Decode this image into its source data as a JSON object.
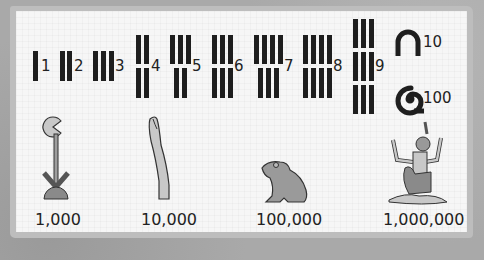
{
  "colors": {
    "stroke": "#1e1e1e",
    "glyph_fill": "#bdbdbd",
    "glyph_dark": "#8a8a8a",
    "paper": "#f6f6f6",
    "border": "#bdbdbd"
  },
  "numerals": [
    {
      "value_label": "1",
      "glyph": "single-stroke-icon"
    },
    {
      "value_label": "2",
      "glyph": "two-strokes-icon"
    },
    {
      "value_label": "3",
      "glyph": "three-strokes-icon"
    },
    {
      "value_label": "4",
      "glyph": "four-strokes-icon"
    },
    {
      "value_label": "5",
      "glyph": "five-strokes-icon"
    },
    {
      "value_label": "6",
      "glyph": "six-strokes-icon"
    },
    {
      "value_label": "7",
      "glyph": "seven-strokes-icon"
    },
    {
      "value_label": "8",
      "glyph": "eight-strokes-icon"
    },
    {
      "value_label": "9",
      "glyph": "nine-strokes-icon"
    },
    {
      "value_label": "10",
      "glyph": "heel-bone-icon"
    },
    {
      "value_label": "100",
      "glyph": "coil-of-rope-icon"
    },
    {
      "value_label": "1,000",
      "glyph": "lotus-plant-icon"
    },
    {
      "value_label": "10,000",
      "glyph": "finger-icon"
    },
    {
      "value_label": "100,000",
      "glyph": "frog-icon"
    },
    {
      "value_label": "1,000,000",
      "glyph": "kneeling-god-heh-icon"
    }
  ]
}
